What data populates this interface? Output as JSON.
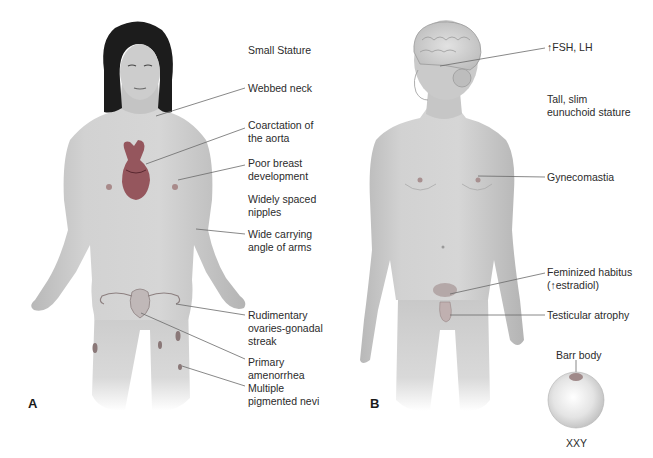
{
  "figure": {
    "panel_a": {
      "letter": "A",
      "subject": "Turner syndrome (45,XO) female",
      "labels": [
        {
          "id": "small-stature",
          "text": "Small Stature"
        },
        {
          "id": "webbed-neck",
          "text": "Webbed neck"
        },
        {
          "id": "coarctation",
          "text": "Coarctation of\nthe aorta"
        },
        {
          "id": "poor-breast",
          "text": "Poor breast\ndevelopment"
        },
        {
          "id": "widely-spaced",
          "text": "Widely spaced\nnipples"
        },
        {
          "id": "carrying-angle",
          "text": "Wide carrying\nangle of arms"
        },
        {
          "id": "rudimentary-ovaries",
          "text": "Rudimentary\novaries-gonadal\nstreak"
        },
        {
          "id": "amenorrhea",
          "text": "Primary\namenorrhea"
        },
        {
          "id": "nevi",
          "text": "Multiple\npigmented nevi"
        }
      ]
    },
    "panel_b": {
      "letter": "B",
      "subject": "Klinefelter syndrome (47,XXY) male",
      "labels": [
        {
          "id": "fsh-lh",
          "text": "↑FSH, LH"
        },
        {
          "id": "tall-stature",
          "text": "Tall, slim\neunuchoid stature"
        },
        {
          "id": "gynecomastia",
          "text": "Gynecomastia"
        },
        {
          "id": "feminized",
          "text": "Feminized habitus\n(↑estradiol)"
        },
        {
          "id": "testicular",
          "text": "Testicular atrophy"
        }
      ],
      "cell": {
        "barr_label": "Barr body",
        "karyotype": "XXY"
      }
    },
    "colors": {
      "skin": "#cfcfcf",
      "skin_shadow": "#a9a9a9",
      "hair": "#1c1c1c",
      "heart": "#8a3f48",
      "leader": "#6a6a6a",
      "text": "#2b2b2b"
    }
  }
}
